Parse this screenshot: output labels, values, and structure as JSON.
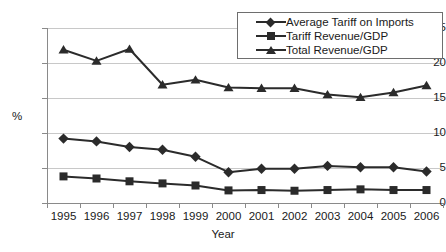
{
  "chart_data": {
    "type": "line",
    "title": "",
    "xlabel": "Year",
    "ylabel": "%",
    "categories": [
      "1995",
      "1996",
      "1997",
      "1998",
      "1999",
      "2000",
      "2001",
      "2002",
      "2003",
      "2004",
      "2005",
      "2006"
    ],
    "ylim": [
      0,
      25
    ],
    "yticks": [
      0,
      5,
      10,
      15,
      20,
      25
    ],
    "ytick_labels": [
      "0",
      "5",
      "10",
      "15",
      "20",
      "25"
    ],
    "grid": "horizontal",
    "legend_position": "top-right",
    "series": [
      {
        "name": "Average Tariff on Imports",
        "marker": "diamond",
        "color": "#2b2b2b",
        "values": [
          9.2,
          8.8,
          8.0,
          7.6,
          6.6,
          4.4,
          4.9,
          4.9,
          5.3,
          5.1,
          5.1,
          4.5
        ]
      },
      {
        "name": "Tariff Revenue/GDP",
        "marker": "square",
        "color": "#2b2b2b",
        "values": [
          3.8,
          3.5,
          3.1,
          2.8,
          2.5,
          1.8,
          1.85,
          1.75,
          1.85,
          1.95,
          1.85,
          1.85
        ]
      },
      {
        "name": "Total Revenue/GDP",
        "marker": "triangle",
        "color": "#2b2b2b",
        "values": [
          21.9,
          20.3,
          22.0,
          16.9,
          17.6,
          16.5,
          16.4,
          16.4,
          15.5,
          15.1,
          15.8,
          16.8
        ]
      }
    ]
  },
  "legend": {
    "items": [
      {
        "label": "Average Tariff on Imports",
        "marker": "diamond"
      },
      {
        "label": "Tariff Revenue/GDP",
        "marker": "square"
      },
      {
        "label": "Total Revenue/GDP",
        "marker": "triangle"
      }
    ]
  },
  "colors": {
    "series": "#2b2b2b",
    "grid": "#c8c8c8",
    "axis": "#8a8a8a",
    "text": "#1a1a1a",
    "background": "#ffffff"
  }
}
